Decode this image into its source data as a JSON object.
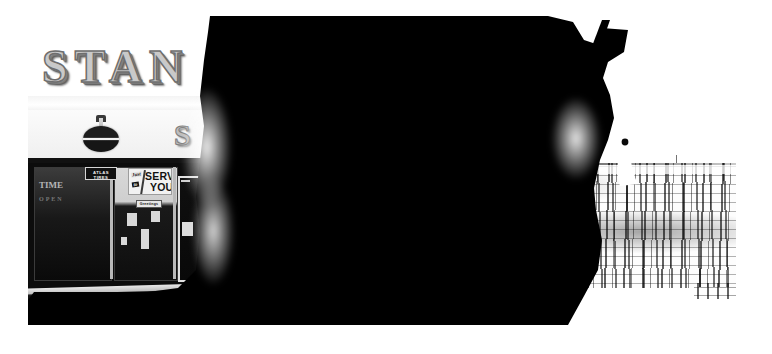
{
  "photograph": {
    "title": "Black and white photograph of a service-station storefront seen past a dark silhouette",
    "medium": "gelatin silver print",
    "orientation": "landscape",
    "tonality": "high contrast black and white",
    "print_border": "white paper margin on left, right and bottom edges"
  },
  "palette": {
    "black": "#000000",
    "white": "#ffffff",
    "paper": "#ffffff",
    "dark_glass": "#0c0c0c",
    "sign_metal": "#c9c9c9",
    "facade": "#f4f4f4",
    "mid_grey": "#9a9a9a"
  },
  "scene": {
    "left_region": "storefront",
    "right_region": "open water and sky beyond a dark silhouette",
    "center_region": "large black occluding shape spanning the frame"
  },
  "storefront": {
    "roof_sign": {
      "name": "roof-sign-letters",
      "text": "STAN",
      "note": "large raised three-dimensional block letters, truncated by the dark mass",
      "full_word_implied": "STANDARD"
    },
    "secondary_letter": {
      "name": "secondary-sign-letter",
      "text": "S",
      "note": "second partly hidden sign letter glowing beside the flare"
    },
    "emblem": {
      "name": "roundel-emblem",
      "description": "dark circular roundel on a post above the canopy"
    },
    "signs": [
      {
        "name": "atlas-tires-sign",
        "line1": "ATLAS",
        "line2": "TIRES",
        "style": "white outlined dark plaque"
      },
      {
        "name": "serve-you-poster",
        "word_just": "Just",
        "word_to": "to",
        "word_serve": "SERVE",
        "word_you": "YOU",
        "full_text": "Just to SERVE YOU",
        "style": "white poster with heavy black display lettering"
      },
      {
        "name": "small-window-banner",
        "text": "Greetings",
        "style": "small illegible banner below the poster"
      }
    ],
    "window_ghost_text": {
      "name": "window-ghost-lettering",
      "text": "TIME",
      "note": "faint painted lettering on the left display window"
    },
    "door": {
      "name": "shop-door",
      "description": "glass entrance door with a light frame and a small white notice"
    }
  },
  "silhouette": {
    "name": "foreground-silhouette",
    "description": "unidentifiable black shape filling the upper and central frame, reading as a vehicle roof and a figure",
    "antenna": "thin diagonal antenna rising at upper right",
    "hook": "bright curving hook-like highlight near the figure"
  },
  "background": {
    "sky": {
      "name": "sky",
      "description": "blank blown-out white sky"
    },
    "water": {
      "name": "water-and-shore",
      "description": "coarse high-contrast speckled expanse of water or shore below the horizon"
    },
    "horizon": {
      "name": "horizon-line",
      "description": "thin dark horizon line with a few distant posts"
    }
  },
  "far_posts": [
    {
      "x": 390,
      "y": 150,
      "h": 13
    },
    {
      "x": 452,
      "y": 154,
      "h": 9
    },
    {
      "x": 486,
      "y": 151,
      "h": 12
    },
    {
      "x": 524,
      "y": 156,
      "h": 7
    },
    {
      "x": 601,
      "y": 149,
      "h": 14
    },
    {
      "x": 648,
      "y": 155,
      "h": 8
    }
  ],
  "display_figures": [
    {
      "name": "display-figure-1",
      "x": 10,
      "y": 212,
      "w": 20,
      "h": 26
    },
    {
      "name": "display-figure-2",
      "x": 30,
      "y": 206,
      "w": 24,
      "h": 34
    },
    {
      "name": "display-figure-3",
      "x": 52,
      "y": 210,
      "w": 20,
      "h": 28
    },
    {
      "name": "display-figure-4",
      "x": 26,
      "y": 238,
      "w": 28,
      "h": 34
    }
  ],
  "placards": [
    {
      "name": "placard-1",
      "x": 98,
      "y": 212,
      "w": 10,
      "h": 13
    },
    {
      "name": "placard-2",
      "x": 122,
      "y": 210,
      "w": 9,
      "h": 11
    },
    {
      "name": "placard-3",
      "x": 112,
      "y": 228,
      "w": 8,
      "h": 20
    },
    {
      "name": "placard-4",
      "x": 92,
      "y": 236,
      "w": 6,
      "h": 8
    }
  ]
}
